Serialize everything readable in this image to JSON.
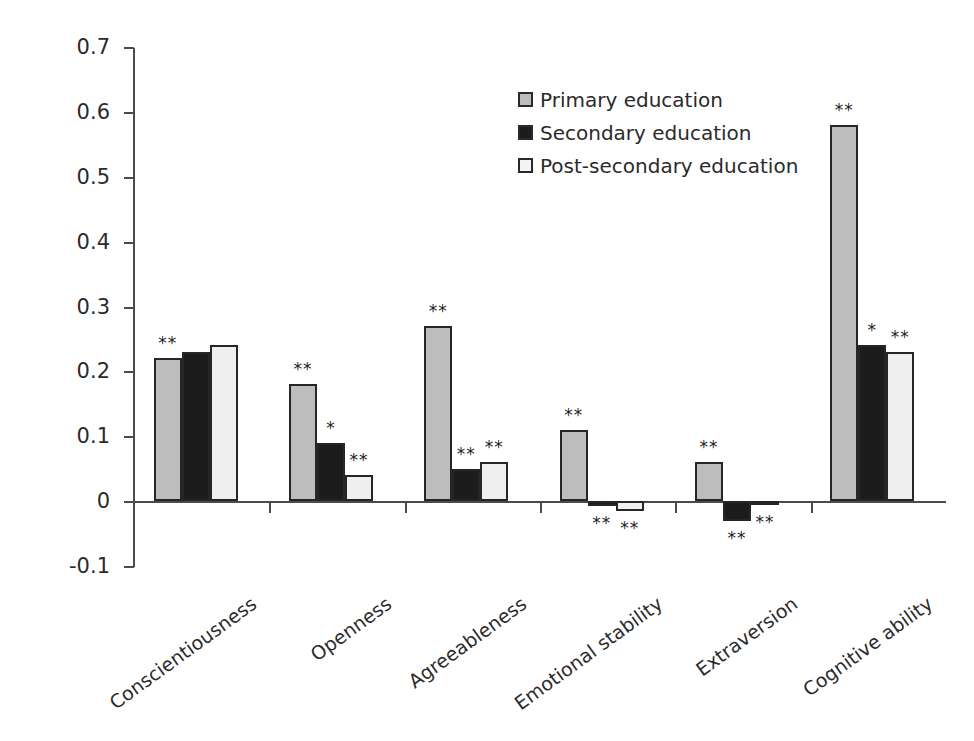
{
  "chart_data": {
    "type": "bar",
    "title": "",
    "xlabel": "",
    "ylabel": "Correlation",
    "ylim": [
      -0.1,
      0.7
    ],
    "ytick_labels": [
      "0.7",
      "0.6",
      "0.5",
      "0.4",
      "0.3",
      "0.2",
      "0.1",
      "0",
      "-0.1"
    ],
    "ytick_values": [
      0.7,
      0.6,
      0.5,
      0.4,
      0.3,
      0.2,
      0.1,
      0,
      -0.1
    ],
    "grid": false,
    "legend_position": "upper-center",
    "categories": [
      "Conscientiousness",
      "Openness",
      "Agreeableness",
      "Emotional stability",
      "Extraversion",
      "Cognitive ability"
    ],
    "series": [
      {
        "name": "Primary education",
        "color": "#bdbdbd",
        "values": [
          0.22,
          0.18,
          0.27,
          0.11,
          0.06,
          0.58
        ],
        "significance": [
          "**",
          "**",
          "**",
          "**",
          "**",
          "**"
        ]
      },
      {
        "name": "Secondary education",
        "color": "#1c1c1c",
        "values": [
          0.23,
          0.09,
          0.05,
          -0.008,
          -0.03,
          0.24
        ],
        "significance": [
          "",
          "*",
          "**",
          "**",
          "**",
          "*"
        ]
      },
      {
        "name": "Post-secondary education",
        "color": "#efefef",
        "values": [
          0.24,
          0.04,
          0.06,
          -0.015,
          -0.005,
          0.23
        ],
        "significance": [
          "",
          "**",
          "**",
          "**",
          "**",
          "**"
        ]
      }
    ]
  },
  "legend": {
    "items": [
      {
        "label": "Primary education"
      },
      {
        "label": "Secondary education"
      },
      {
        "label": "Post-secondary education"
      }
    ]
  },
  "axis": {
    "y_title": "Correlation"
  }
}
